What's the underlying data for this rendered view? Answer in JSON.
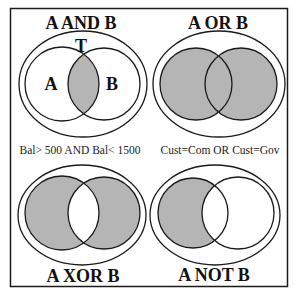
{
  "colors": {
    "fill": "#b5b5b5",
    "stroke": "#1a1a1a",
    "background": "#ffffff"
  },
  "panels": [
    {
      "id": "and",
      "title": "A AND B",
      "shaded": "intersection",
      "universe_label": "T",
      "set_labels": [
        "A",
        "B"
      ],
      "caption": "Bal> 500 AND Bal< 1500"
    },
    {
      "id": "or",
      "title": "A OR B",
      "shaded": "union",
      "caption": "Cust=Com OR Cust=Gov"
    },
    {
      "id": "xor",
      "title": "A XOR B",
      "shaded": "symmetric-difference"
    },
    {
      "id": "not",
      "title": "A NOT B",
      "shaded": "A-minus-B"
    }
  ]
}
